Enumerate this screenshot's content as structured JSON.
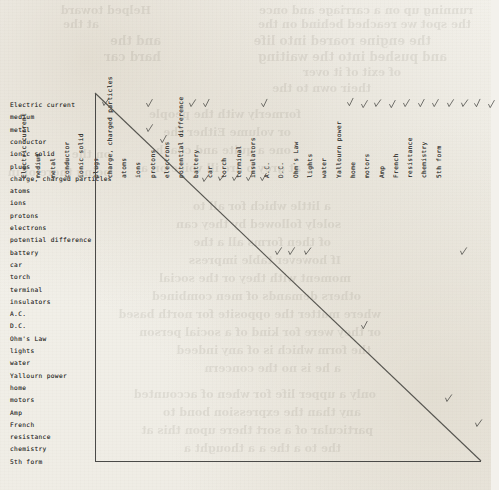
{
  "document": {
    "kind": "hand-annotated concept relation matrix",
    "title": "",
    "paper_color": "#f3f1ec",
    "ink_color": "#30302e",
    "rule_color": "#4a4a48"
  },
  "terms": [
    "Electric current",
    "medium",
    "metal",
    "conductor",
    "ionic solid",
    "plugs",
    "charge, charged particles",
    "atoms",
    "ions",
    "protons",
    "electrons",
    "potential difference",
    "battery",
    "car",
    "torch",
    "terminal",
    "insulators",
    "A.C.",
    "D.C.",
    "Ohm's Law",
    "lights",
    "water",
    "Yallourn power",
    "home",
    "motors",
    "Amp",
    "French",
    "resistance",
    "chemistry",
    "5th form"
  ],
  "row_labels": [
    "Electric current",
    "medium",
    "metal",
    "conductor",
    "ionic solid",
    "plugs",
    "charge, charged particles",
    "atoms",
    "ions",
    "protons",
    "electrons",
    "potential difference",
    "battery",
    "car",
    "torch",
    "terminal",
    "insulators",
    "A.C.",
    "D.C.",
    "Ohm's Law",
    "lights",
    "water",
    "Yallourn power",
    "home",
    "motors",
    "Amp",
    "French",
    "resistance",
    "chemistry",
    "5th form"
  ],
  "column_labels": [
    "Electric current",
    "medium",
    "metal",
    "conductor",
    "ionic solid",
    "plugs",
    "charge, charged particles",
    "atoms",
    "ions",
    "protons",
    "electrons",
    "potential difference",
    "battery",
    "car",
    "torch",
    "terminal",
    "insulators",
    "A.C.",
    "D.C.",
    "Ohm's Law",
    "lights",
    "water",
    "Yallourn power",
    "home",
    "motors",
    "Amp",
    "French",
    "resistance",
    "chemistry",
    "5th form"
  ],
  "marks": [
    {
      "row": 0,
      "col": 0
    },
    {
      "row": 0,
      "col": 3
    },
    {
      "row": 0,
      "col": 6
    },
    {
      "row": 0,
      "col": 7
    },
    {
      "row": 0,
      "col": 11
    },
    {
      "row": 0,
      "col": 17
    },
    {
      "row": 0,
      "col": 18
    },
    {
      "row": 0,
      "col": 19
    },
    {
      "row": 0,
      "col": 20
    },
    {
      "row": 0,
      "col": 21
    },
    {
      "row": 0,
      "col": 22
    },
    {
      "row": 0,
      "col": 23
    },
    {
      "row": 0,
      "col": 24
    },
    {
      "row": 0,
      "col": 25
    },
    {
      "row": 0,
      "col": 26
    },
    {
      "row": 0,
      "col": 27
    },
    {
      "row": 2,
      "col": 3
    },
    {
      "row": 3,
      "col": 4
    },
    {
      "row": 6,
      "col": 7
    },
    {
      "row": 6,
      "col": 8
    },
    {
      "row": 6,
      "col": 9
    },
    {
      "row": 6,
      "col": 10
    },
    {
      "row": 6,
      "col": 11
    },
    {
      "row": 12,
      "col": 12
    },
    {
      "row": 12,
      "col": 13
    },
    {
      "row": 12,
      "col": 14
    },
    {
      "row": 12,
      "col": 25
    },
    {
      "row": 18,
      "col": 18
    },
    {
      "row": 24,
      "col": 24
    },
    {
      "row": 26,
      "col": 26
    }
  ],
  "geometry": {
    "grid_left": 95,
    "grid_top": 93,
    "grid_right": 481,
    "grid_bottom": 461,
    "row_step": 12.3,
    "col_step": 14.3,
    "first_row_y": 105,
    "first_col_x": 103
  },
  "bleed_through_fragments": [
    {
      "text": "running up on a carriage and once",
      "x": 18,
      "y": 4,
      "size": 11
    },
    {
      "text": "Helped toward",
      "x": 340,
      "y": 4,
      "size": 11
    },
    {
      "text": "the spot we reached behind on the",
      "x": 20,
      "y": 18,
      "size": 11
    },
    {
      "text": "at the",
      "x": 392,
      "y": 18,
      "size": 11
    },
    {
      "text": "the engine roared into life",
      "x": 60,
      "y": 34,
      "size": 12
    },
    {
      "text": "and the",
      "x": 330,
      "y": 34,
      "size": 12
    },
    {
      "text": "and pushed into the waiting",
      "x": 44,
      "y": 50,
      "size": 12
    },
    {
      "text": "hard car",
      "x": 330,
      "y": 50,
      "size": 12
    },
    {
      "text": "of exit of it over",
      "x": 90,
      "y": 66,
      "size": 11
    },
    {
      "text": "their own to the",
      "x": 120,
      "y": 82,
      "size": 11
    },
    {
      "text": "formerly with the people",
      "x": 190,
      "y": 108,
      "size": 11
    },
    {
      "text": "or volume Either the",
      "x": 200,
      "y": 126,
      "size": 11
    },
    {
      "text": "one a quite and coach",
      "x": 200,
      "y": 144,
      "size": 11
    },
    {
      "text": "at grey p are ill voice on a",
      "x": 190,
      "y": 162,
      "size": 11
    },
    {
      "text": "on the",
      "x": 380,
      "y": 148,
      "size": 11
    },
    {
      "text": "being there of in",
      "x": 380,
      "y": 166,
      "size": 11
    },
    {
      "text": "a little which for all to",
      "x": 160,
      "y": 200,
      "size": 11
    },
    {
      "text": "solely followed by they can",
      "x": 150,
      "y": 218,
      "size": 11
    },
    {
      "text": "of then forms all a the",
      "x": 160,
      "y": 236,
      "size": 11
    },
    {
      "text": "If however table impress",
      "x": 150,
      "y": 254,
      "size": 11
    },
    {
      "text": "moment with they or the social",
      "x": 140,
      "y": 272,
      "size": 11
    },
    {
      "text": "others demands of men combined",
      "x": 130,
      "y": 290,
      "size": 11
    },
    {
      "text": "where matter the opposite for north based",
      "x": 110,
      "y": 308,
      "size": 11
    },
    {
      "text": "or they were for kind of a social person",
      "x": 110,
      "y": 326,
      "size": 11
    },
    {
      "text": "the form which is of any indeed",
      "x": 120,
      "y": 344,
      "size": 11
    },
    {
      "text": "a he is no the concern",
      "x": 150,
      "y": 362,
      "size": 11
    },
    {
      "text": "only a upper life for when of accounted",
      "x": 115,
      "y": 388,
      "size": 11
    },
    {
      "text": "any than the expression bond to",
      "x": 130,
      "y": 406,
      "size": 11
    },
    {
      "text": "particular of a sort there upon this at",
      "x": 118,
      "y": 424,
      "size": 11
    },
    {
      "text": "the to a the a a thought a",
      "x": 150,
      "y": 442,
      "size": 11
    }
  ]
}
